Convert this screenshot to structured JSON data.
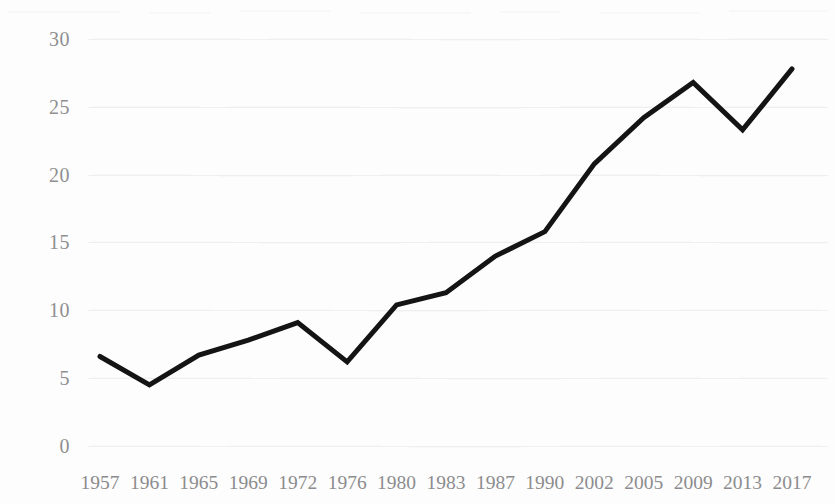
{
  "chart_data": {
    "type": "line",
    "title": "",
    "subtitle": "",
    "xlabel": "",
    "ylabel": "",
    "categories": [
      "1957",
      "1961",
      "1965",
      "1969",
      "1972",
      "1976",
      "1980",
      "1983",
      "1987",
      "1990",
      "2002",
      "2005",
      "2009",
      "2013",
      "2017"
    ],
    "values": [
      6.6,
      4.5,
      6.7,
      7.8,
      9.1,
      6.2,
      10.4,
      11.3,
      14.0,
      15.8,
      20.8,
      24.2,
      26.8,
      23.3,
      27.8
    ],
    "series": [
      {
        "name": "",
        "values": [
          6.6,
          4.5,
          6.7,
          7.8,
          9.1,
          6.2,
          10.4,
          11.3,
          14.0,
          15.8,
          20.8,
          24.2,
          26.8,
          23.3,
          27.8
        ]
      }
    ],
    "ylim": [
      0,
      30
    ],
    "yticks": [
      0,
      5,
      10,
      15,
      20,
      25,
      30
    ],
    "ytick_labels": [
      "0",
      "5",
      "10",
      "15",
      "20",
      "25",
      "30"
    ],
    "xtick_labels": [
      "1957",
      "1961",
      "1965",
      "1969",
      "1972",
      "1976",
      "1980",
      "1983",
      "1987",
      "1990",
      "2002",
      "2005",
      "2009",
      "2013",
      "2017"
    ],
    "grid": true,
    "grid_axis": "y",
    "legend": false,
    "legend_position": "none",
    "line_color": "#141414",
    "line_width": 5,
    "markers": false,
    "axis_label_color": "#8c8c8e",
    "grid_color": "#f0f0f1",
    "background_color": "#fdfdfd"
  },
  "axes": {
    "y_labels": [
      "30",
      "25",
      "20",
      "15",
      "10",
      "5",
      "0"
    ],
    "x_labels": [
      "1957",
      "1961",
      "1965",
      "1969",
      "1972",
      "1976",
      "1980",
      "1983",
      "1987",
      "1990",
      "2002",
      "2005",
      "2009",
      "2013",
      "2017"
    ]
  }
}
